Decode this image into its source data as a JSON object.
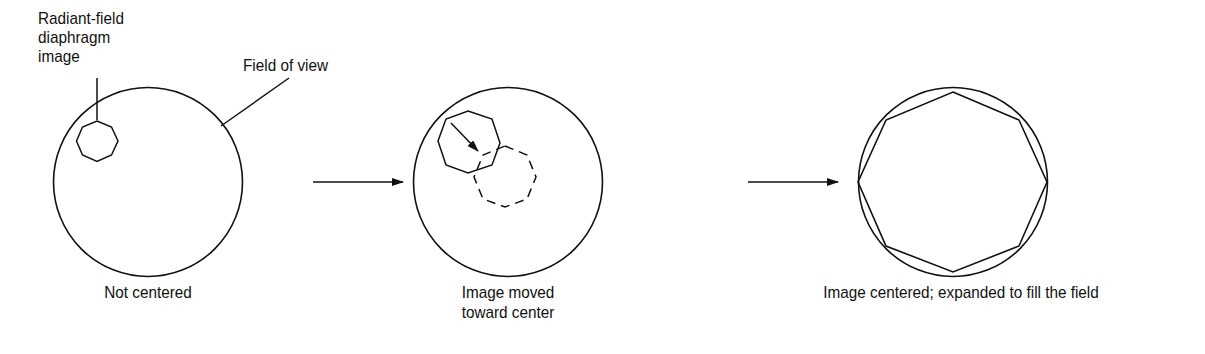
{
  "figure": {
    "stroke_color": "#111111",
    "background_color": "#ffffff",
    "annotations": {
      "diaphragm_label_line1": "Radiant-field",
      "diaphragm_label_line2": "diaphragm",
      "diaphragm_label_line3": "image",
      "field_of_view_label": "Field of view"
    },
    "panels": [
      {
        "id": "not-centered",
        "caption_line1": "Not centered",
        "caption_line2": ""
      },
      {
        "id": "moved-toward-center",
        "caption_line1": "Image moved",
        "caption_line2": "toward center"
      },
      {
        "id": "centered-expanded",
        "caption_line1": "Image centered; expanded to fill the field",
        "caption_line2": ""
      }
    ],
    "transition_arrows": [
      "arrow-1-to-2",
      "arrow-2-to-3"
    ]
  }
}
